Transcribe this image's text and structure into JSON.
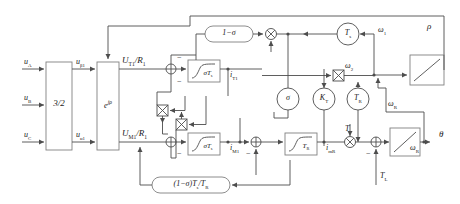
{
  "diagram": {
    "type": "control-block-diagram",
    "colors": {
      "line": "#4d4d4d",
      "block_stroke": "#808080",
      "text": "#1a1a1a",
      "background": "#ffffff"
    }
  },
  "inputs": [
    {
      "name": "phase-a-voltage",
      "label": "u",
      "sub": "A"
    },
    {
      "name": "phase-b-voltage",
      "label": "u",
      "sub": "B"
    },
    {
      "name": "phase-c-voltage",
      "label": "u",
      "sub": "C"
    },
    {
      "name": "load-torque",
      "label": "T",
      "sub": "L"
    }
  ],
  "outputs": [
    {
      "name": "rotor-angle",
      "label": "θ",
      "sub": ""
    }
  ],
  "blocks": [
    {
      "name": "three-to-two-transform",
      "label": "3/2",
      "shape": "rect"
    },
    {
      "name": "rotation-transform",
      "label": "e",
      "sup": "jρ",
      "shape": "rect"
    },
    {
      "name": "one-minus-sigma-gain",
      "label": "1−σ",
      "shape": "rounded"
    },
    {
      "name": "sigma-ts-integrator-top",
      "label": "σT",
      "sub": "s",
      "shape": "integrator"
    },
    {
      "name": "sigma-ts-integrator-bottom",
      "label": "σT",
      "sub": "s",
      "shape": "integrator"
    },
    {
      "name": "tr-integrator",
      "label": "T",
      "sub": "R",
      "shape": "integrator"
    },
    {
      "name": "ts-gain",
      "label": "T",
      "sub": "s",
      "shape": "circle"
    },
    {
      "name": "sigma-gain",
      "label": "σ",
      "sub": "",
      "shape": "circle"
    },
    {
      "name": "kt-gain",
      "label": "K",
      "sub": "T",
      "shape": "circle"
    },
    {
      "name": "tr-gain",
      "label": "T",
      "sub": "R",
      "shape": "circle"
    },
    {
      "name": "one-minus-sigma-ts-over-tr-gain",
      "label": "(1−σ)T",
      "sub": "s",
      "label2": "/T",
      "sub2": "R",
      "shape": "rounded"
    },
    {
      "name": "speed-integrator",
      "label": "",
      "shape": "ramp"
    },
    {
      "name": "angle-integrator",
      "label": "",
      "shape": "ramp"
    },
    {
      "name": "rho-integrator",
      "label": "",
      "shape": "ramp"
    }
  ],
  "signals": [
    {
      "name": "stator-voltage-beta",
      "label": "u",
      "sub": "β1"
    },
    {
      "name": "stator-voltage-alpha",
      "label": "u",
      "sub": "α1"
    },
    {
      "name": "torque-axis-voltage",
      "label": "U",
      "sub": "T1",
      "suffix": "/R",
      "suffix_sub": "1"
    },
    {
      "name": "flux-axis-voltage",
      "label": "U",
      "sub": "M1",
      "suffix": "/R",
      "suffix_sub": "1"
    },
    {
      "name": "torque-current",
      "label": "i",
      "sub": "T1"
    },
    {
      "name": "flux-current",
      "label": "i",
      "sub": "M1"
    },
    {
      "name": "magnetizing-current",
      "label": "i",
      "sub": "mR"
    },
    {
      "name": "slip-frequency",
      "label": "ω",
      "sub": "2"
    },
    {
      "name": "stator-frequency",
      "label": "ω",
      "sub": "1"
    },
    {
      "name": "rotor-speed",
      "label": "ω",
      "sub": "R"
    },
    {
      "name": "rotor-speed-feedback",
      "label": "ω",
      "sub": "R"
    },
    {
      "name": "electromagnetic-torque",
      "label": "T",
      "sub": ""
    },
    {
      "name": "field-angle",
      "label": "ρ",
      "sub": ""
    }
  ],
  "operators": [
    {
      "name": "multiplier-top",
      "symbol": "⊗"
    },
    {
      "name": "multiplier-mid",
      "symbol": "⊗"
    },
    {
      "name": "multiplier-slip",
      "symbol": "⊗"
    },
    {
      "name": "multiplier-bottom",
      "symbol": "⊗"
    },
    {
      "name": "multiplier-torque",
      "symbol": "⊗"
    },
    {
      "name": "sum-torque-axis",
      "symbol": "+"
    },
    {
      "name": "sum-flux-axis",
      "symbol": "+"
    },
    {
      "name": "sum-rotor-flux",
      "symbol": "+"
    },
    {
      "name": "sum-mechanical",
      "symbol": "+"
    }
  ],
  "signs": {
    "minus": "−"
  }
}
